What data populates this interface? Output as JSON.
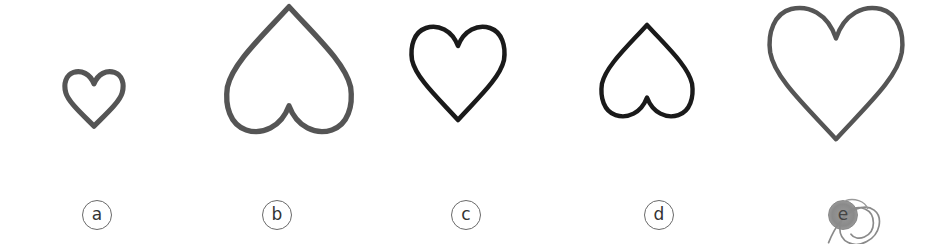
{
  "figure": {
    "options": [
      {
        "id": "a",
        "label": "a",
        "orientation": "upright",
        "size": "small",
        "stroke": "#555555",
        "box": {
          "x": 62,
          "y": 66,
          "w": 64,
          "h": 64
        }
      },
      {
        "id": "b",
        "label": "b",
        "orientation": "inverted",
        "size": "large",
        "stroke": "#555555",
        "box": {
          "x": 222,
          "y": 2,
          "w": 134,
          "h": 138
        }
      },
      {
        "id": "c",
        "label": "c",
        "orientation": "upright",
        "size": "medium",
        "stroke": "#1a1a1a",
        "box": {
          "x": 408,
          "y": 22,
          "w": 100,
          "h": 100
        }
      },
      {
        "id": "d",
        "label": "d",
        "orientation": "inverted",
        "size": "medium",
        "stroke": "#1a1a1a",
        "box": {
          "x": 598,
          "y": 22,
          "w": 98,
          "h": 100
        }
      },
      {
        "id": "e",
        "label": "e",
        "orientation": "upright",
        "size": "large",
        "stroke": "#555555",
        "box": {
          "x": 766,
          "y": 2,
          "w": 140,
          "h": 140
        },
        "marked": true
      }
    ],
    "selected_option": "e"
  }
}
